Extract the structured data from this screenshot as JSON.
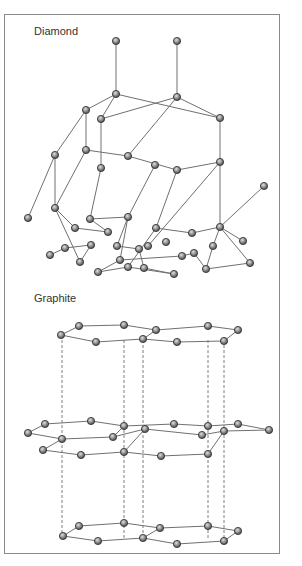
{
  "diamond": {
    "title": "Diamond",
    "atoms": [
      [
        116,
        41
      ],
      [
        177,
        41
      ],
      [
        116,
        94
      ],
      [
        177,
        97
      ],
      [
        86,
        110
      ],
      [
        101,
        119
      ],
      [
        220,
        118
      ],
      [
        55,
        155
      ],
      [
        86,
        150
      ],
      [
        128,
        156
      ],
      [
        101,
        168
      ],
      [
        155,
        165
      ],
      [
        177,
        170
      ],
      [
        220,
        162
      ],
      [
        28,
        218
      ],
      [
        55,
        208
      ],
      [
        75,
        228
      ],
      [
        90,
        219
      ],
      [
        128,
        217
      ],
      [
        108,
        232
      ],
      [
        156,
        228
      ],
      [
        192,
        233
      ],
      [
        220,
        227
      ],
      [
        148,
        246
      ],
      [
        264,
        186
      ],
      [
        50,
        255
      ],
      [
        65,
        248
      ],
      [
        80,
        262
      ],
      [
        91,
        245
      ],
      [
        117,
        246
      ],
      [
        139,
        249
      ],
      [
        120,
        260
      ],
      [
        98,
        272
      ],
      [
        128,
        267
      ],
      [
        166,
        242
      ],
      [
        182,
        256
      ],
      [
        194,
        253
      ],
      [
        206,
        269
      ],
      [
        213,
        246
      ],
      [
        243,
        241
      ],
      [
        250,
        263
      ],
      [
        174,
        274
      ],
      [
        144,
        268
      ]
    ],
    "bonds": [
      [
        0,
        2
      ],
      [
        1,
        3
      ],
      [
        2,
        4
      ],
      [
        2,
        5
      ],
      [
        2,
        6
      ],
      [
        3,
        6
      ],
      [
        3,
        5
      ],
      [
        3,
        9
      ],
      [
        6,
        13
      ],
      [
        4,
        8
      ],
      [
        5,
        10
      ],
      [
        9,
        8
      ],
      [
        9,
        12
      ],
      [
        13,
        12
      ],
      [
        13,
        23
      ],
      [
        4,
        7
      ],
      [
        7,
        14
      ],
      [
        7,
        15
      ],
      [
        8,
        15
      ],
      [
        10,
        17
      ],
      [
        12,
        20
      ],
      [
        11,
        18
      ],
      [
        13,
        22
      ],
      [
        22,
        24
      ],
      [
        15,
        16
      ],
      [
        15,
        27
      ],
      [
        16,
        19
      ],
      [
        17,
        19
      ],
      [
        17,
        18
      ],
      [
        18,
        29
      ],
      [
        20,
        21
      ],
      [
        21,
        22
      ],
      [
        20,
        33
      ],
      [
        22,
        38
      ],
      [
        22,
        39
      ],
      [
        38,
        37
      ],
      [
        18,
        31
      ],
      [
        29,
        30
      ],
      [
        31,
        32
      ],
      [
        31,
        35
      ],
      [
        35,
        36
      ],
      [
        36,
        37
      ],
      [
        37,
        40
      ],
      [
        40,
        22
      ],
      [
        32,
        33
      ],
      [
        33,
        41
      ],
      [
        30,
        42
      ],
      [
        41,
        42
      ],
      [
        27,
        28
      ],
      [
        28,
        26
      ],
      [
        26,
        25
      ]
    ]
  },
  "graphite": {
    "title": "Graphite",
    "layers": [
      {
        "y": 0,
        "atoms": [
          [
            61,
            335
          ],
          [
            79,
            326
          ],
          [
            124,
            325
          ],
          [
            96,
            342
          ],
          [
            143,
            339
          ],
          [
            156,
            330
          ],
          [
            208,
            326
          ],
          [
            177,
            342
          ],
          [
            224,
            341
          ],
          [
            238,
            330
          ]
        ]
      },
      {
        "y": 0,
        "atoms": [
          [
            28,
            433
          ],
          [
            45,
            424
          ],
          [
            62,
            439
          ],
          [
            91,
            421
          ],
          [
            113,
            437
          ],
          [
            124,
            426
          ],
          [
            145,
            429
          ],
          [
            174,
            424
          ],
          [
            202,
            435
          ],
          [
            208,
            426
          ],
          [
            238,
            424
          ],
          [
            224,
            431
          ],
          [
            269,
            430
          ],
          [
            43,
            450
          ],
          [
            81,
            455
          ],
          [
            124,
            452
          ],
          [
            161,
            456
          ],
          [
            208,
            454
          ]
        ]
      },
      {
        "y": 0,
        "atoms": [
          [
            63,
            536
          ],
          [
            79,
            526
          ],
          [
            98,
            541
          ],
          [
            124,
            523
          ],
          [
            143,
            538
          ],
          [
            160,
            528
          ],
          [
            177,
            544
          ],
          [
            208,
            526
          ],
          [
            224,
            541
          ],
          [
            238,
            531
          ]
        ]
      }
    ],
    "top_bonds": [
      [
        0,
        1
      ],
      [
        1,
        2
      ],
      [
        2,
        5
      ],
      [
        0,
        3
      ],
      [
        3,
        4
      ],
      [
        4,
        5
      ],
      [
        5,
        6
      ],
      [
        6,
        9
      ],
      [
        4,
        7
      ],
      [
        7,
        8
      ],
      [
        8,
        9
      ]
    ],
    "mid_bonds": [
      [
        0,
        1
      ],
      [
        1,
        3
      ],
      [
        3,
        5
      ],
      [
        0,
        2
      ],
      [
        2,
        4
      ],
      [
        4,
        5
      ],
      [
        5,
        7
      ],
      [
        7,
        9
      ],
      [
        9,
        10
      ],
      [
        10,
        12
      ],
      [
        6,
        4
      ],
      [
        6,
        8
      ],
      [
        8,
        11
      ],
      [
        11,
        12
      ],
      [
        2,
        13
      ],
      [
        13,
        14
      ],
      [
        14,
        15
      ],
      [
        15,
        6
      ],
      [
        15,
        16
      ],
      [
        16,
        17
      ],
      [
        17,
        11
      ]
    ],
    "bot_bonds": [
      [
        0,
        1
      ],
      [
        1,
        3
      ],
      [
        3,
        5
      ],
      [
        0,
        2
      ],
      [
        2,
        4
      ],
      [
        4,
        5
      ],
      [
        5,
        7
      ],
      [
        7,
        9
      ],
      [
        4,
        6
      ],
      [
        6,
        8
      ],
      [
        8,
        9
      ]
    ],
    "dashed_x": [
      62,
      124,
      143,
      208,
      224
    ]
  },
  "colors": {
    "bond": "#707070",
    "atom_fill": "#8d8d8d",
    "atom_stroke": "#3a3a3a",
    "frame": "#8a8a8a",
    "label": "#333333"
  }
}
